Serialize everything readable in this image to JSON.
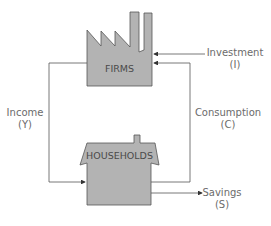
{
  "diagram": {
    "type": "circular-flow",
    "nodes": {
      "firms": {
        "label": "FIRMS",
        "icon": "factory-icon"
      },
      "households": {
        "label": "HOUSEHOLDS",
        "icon": "house-icon"
      }
    },
    "flows": {
      "investment": {
        "name": "Investment",
        "symbol": "(I)"
      },
      "consumption": {
        "name": "Consumption",
        "symbol": "(C)"
      },
      "income": {
        "name": "Income",
        "symbol": "(Y)"
      },
      "savings": {
        "name": "Savings",
        "symbol": "(S)"
      }
    },
    "colors": {
      "shape_fill": "#b3b3b3",
      "shape_stroke": "#555555",
      "line": "#555555",
      "text": "#6b6b6b"
    }
  }
}
